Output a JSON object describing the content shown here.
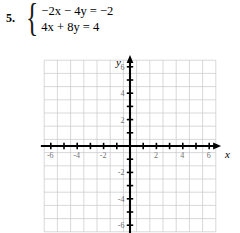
{
  "problem": {
    "number": "5.",
    "equations": [
      {
        "text": "−2x − 4y = −2",
        "lhs": "−2x − 4y",
        "rhs": "−2"
      },
      {
        "text": "4x + 8y = 4",
        "lhs": "4x + 8y",
        "rhs": "4"
      }
    ],
    "brace": "{"
  },
  "chart_data": {
    "type": "scatter",
    "title": "",
    "xlabel": "x",
    "ylabel": "y",
    "xlim": [
      -6.6,
      6.6
    ],
    "ylim": [
      -6.6,
      6.6
    ],
    "grid": true,
    "grid_step": 1,
    "grid_color": "#c9c9cc",
    "axis_color": "#000000",
    "legend": "none",
    "x_ticks": [
      -6,
      -4,
      -2,
      2,
      4,
      6
    ],
    "x_tick_labels": [
      "-6",
      "-4",
      "-2",
      "2",
      "4",
      "6"
    ],
    "y_ticks": [
      6,
      4,
      2,
      -2,
      -4,
      -6
    ],
    "y_tick_labels": [
      "6",
      "4",
      "2",
      "-2",
      "-4",
      "-6"
    ],
    "minor_ticks_x": [
      -6,
      -5,
      -4,
      -3,
      -2,
      -1,
      1,
      2,
      3,
      4,
      5,
      6
    ],
    "minor_ticks_y": [
      -6,
      -5,
      -4,
      -3,
      -2,
      -1,
      1,
      2,
      3,
      4,
      5,
      6
    ],
    "series": [
      {
        "name": "-2x - 4y = -2",
        "values": []
      },
      {
        "name": "4x + 8y = 4",
        "values": []
      }
    ],
    "note": "blank grid — no lines plotted"
  },
  "axis_names": {
    "x": "x",
    "y": "y"
  }
}
